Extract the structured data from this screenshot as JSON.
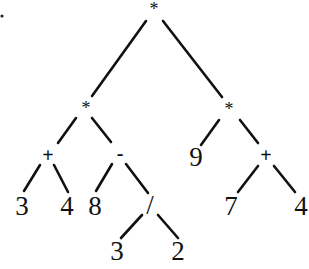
{
  "diagram": {
    "type": "expression-tree",
    "stray_mark": ".",
    "nodes": {
      "root": {
        "label": "*",
        "x": 154,
        "y": 9
      },
      "left_mul": {
        "label": "*",
        "x": 86,
        "y": 108
      },
      "right_mul": {
        "label": "*",
        "x": 229,
        "y": 109
      },
      "plus_left": {
        "label": "+",
        "x": 48,
        "y": 155
      },
      "minus": {
        "label": "-",
        "x": 120,
        "y": 153
      },
      "nine": {
        "label": "9",
        "x": 196,
        "y": 157
      },
      "plus_right": {
        "label": "+",
        "x": 266,
        "y": 155
      },
      "three_a": {
        "label": "3",
        "x": 22,
        "y": 206
      },
      "four_a": {
        "label": "4",
        "x": 67,
        "y": 206
      },
      "eight": {
        "label": "8",
        "x": 95,
        "y": 206
      },
      "divide": {
        "label": "/",
        "x": 150,
        "y": 205
      },
      "seven": {
        "label": "7",
        "x": 231,
        "y": 206
      },
      "four_b": {
        "label": "4",
        "x": 301,
        "y": 206
      },
      "three_b": {
        "label": "3",
        "x": 117,
        "y": 251
      },
      "two": {
        "label": "2",
        "x": 178,
        "y": 251
      }
    },
    "edges": [
      {
        "from": "root",
        "to": "left_mul",
        "x1": 146,
        "y1": 21,
        "x2": 92,
        "y2": 96
      },
      {
        "from": "root",
        "to": "right_mul",
        "x1": 163,
        "y1": 21,
        "x2": 222,
        "y2": 97
      },
      {
        "from": "left_mul",
        "to": "plus_left",
        "x1": 76,
        "y1": 118,
        "x2": 58,
        "y2": 143
      },
      {
        "from": "left_mul",
        "to": "minus",
        "x1": 92,
        "y1": 118,
        "x2": 111,
        "y2": 142
      },
      {
        "from": "right_mul",
        "to": "nine",
        "x1": 219,
        "y1": 120,
        "x2": 201,
        "y2": 145
      },
      {
        "from": "right_mul",
        "to": "plus_right",
        "x1": 240,
        "y1": 120,
        "x2": 258,
        "y2": 143
      },
      {
        "from": "plus_left",
        "to": "three_a",
        "x1": 40,
        "y1": 165,
        "x2": 24,
        "y2": 191
      },
      {
        "from": "plus_left",
        "to": "four_a",
        "x1": 54,
        "y1": 165,
        "x2": 68,
        "y2": 192
      },
      {
        "from": "minus",
        "to": "eight",
        "x1": 112,
        "y1": 164,
        "x2": 96,
        "y2": 191
      },
      {
        "from": "minus",
        "to": "divide",
        "x1": 126,
        "y1": 164,
        "x2": 148,
        "y2": 193
      },
      {
        "from": "plus_right",
        "to": "seven",
        "x1": 258,
        "y1": 166,
        "x2": 238,
        "y2": 192
      },
      {
        "from": "plus_right",
        "to": "four_b",
        "x1": 274,
        "y1": 166,
        "x2": 295,
        "y2": 192
      },
      {
        "from": "divide",
        "to": "three_b",
        "x1": 142,
        "y1": 215,
        "x2": 121,
        "y2": 238
      },
      {
        "from": "divide",
        "to": "two",
        "x1": 158,
        "y1": 215,
        "x2": 178,
        "y2": 238
      }
    ],
    "expression": "((3 + 4) * (8 - 3 / 2)) * (9 * (7 + 4))"
  }
}
